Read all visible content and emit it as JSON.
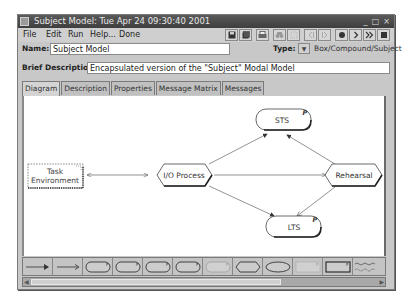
{
  "window": {
    "title": "Subject Model: Tue Apr 24 09:30:40 2001",
    "controls": [
      "_",
      "□",
      "×"
    ]
  },
  "menu": {
    "items": [
      "File",
      "Edit",
      "Run",
      "Help...",
      "Done"
    ]
  },
  "toolbar": {
    "buttons": [
      {
        "name": "save-icon",
        "glyph": "▪",
        "enabled": true
      },
      {
        "name": "save-all-icon",
        "glyph": "◙",
        "enabled": true
      },
      {
        "name": "print-icon",
        "glyph": "⎙",
        "enabled": true
      },
      {
        "name": "find-icon",
        "glyph": "♠",
        "enabled": false
      },
      {
        "name": "select-icon",
        "glyph": "⁘",
        "enabled": false
      },
      {
        "name": "step-back-icon",
        "glyph": "‹|",
        "enabled": false
      },
      {
        "name": "step-icon",
        "glyph": "|›",
        "enabled": false
      },
      {
        "name": "record-icon",
        "glyph": "●",
        "enabled": true
      },
      {
        "name": "play-icon",
        "glyph": "›",
        "enabled": true
      },
      {
        "name": "fast-forward-icon",
        "glyph": "»",
        "enabled": true
      },
      {
        "name": "stop-icon",
        "glyph": "■",
        "enabled": true
      }
    ]
  },
  "form": {
    "name_label": "Name:",
    "name_value": "Subject Model",
    "type_label": "Type:",
    "type_button": "▼",
    "type_value": "Box/Compound/Subject",
    "brief_label": "Brief Description:",
    "brief_value": "Encapsulated version of the \"Subject\" Modal Model"
  },
  "tabs": [
    {
      "label": "Diagram",
      "active": true
    },
    {
      "label": "Description",
      "active": false
    },
    {
      "label": "Properties",
      "active": false
    },
    {
      "label": "Message Matrix",
      "active": false
    },
    {
      "label": "Messages",
      "active": false
    }
  ],
  "diagram": {
    "nodes": {
      "task_env": {
        "line1": "Task",
        "line2": "Environment"
      },
      "io_process": {
        "label": "I/O Process"
      },
      "sts": {
        "label": "STS",
        "badge": "P"
      },
      "rehearsal": {
        "label": "Rehearsal"
      },
      "lts": {
        "label": "LTS",
        "badge": "P"
      }
    }
  },
  "palette": {
    "items": [
      "bidirectional-arrow-tool",
      "arrow-tool",
      "rounded-box-tool",
      "rounded-box-tool-2",
      "rounded-box-tool-3",
      "rounded-box-tool-4",
      "rounded-box-light-tool",
      "hexagon-tool",
      "ellipse-tool",
      "rectangle-light-tool",
      "rectangle-tool",
      "wavy-tool"
    ]
  }
}
